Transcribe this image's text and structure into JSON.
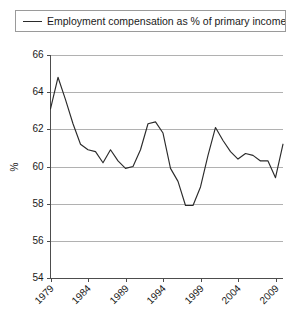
{
  "legend": {
    "position": "top",
    "boxed": true,
    "entries": [
      {
        "label": "Employment compensation as % of primary incomes",
        "marker": "line-marker",
        "color": "#2b2b2b"
      }
    ]
  },
  "axes": {
    "y_title": "%",
    "y_ticks": [
      "54",
      "56",
      "58",
      "60",
      "62",
      "64",
      "66"
    ],
    "x_ticks": [
      "1979",
      "1984",
      "1989",
      "1994",
      "1999",
      "2004",
      "2009"
    ]
  },
  "colors": {
    "line": "#2b2b2b",
    "grid": "#a8a8a8",
    "axis": "#4d4d4d",
    "background": "#ffffff",
    "legend_border": "#9a9a9a"
  },
  "chart_data": {
    "type": "line",
    "title": "",
    "xlabel": "",
    "ylabel": "%",
    "ylim": [
      54,
      66
    ],
    "xlim": [
      1979,
      2010
    ],
    "y_tick_step": 2,
    "grid": true,
    "legend_position": "top",
    "x": [
      1979,
      1980,
      1981,
      1982,
      1983,
      1984,
      1985,
      1986,
      1987,
      1988,
      1989,
      1990,
      1991,
      1992,
      1993,
      1994,
      1995,
      1996,
      1997,
      1998,
      1999,
      2000,
      2001,
      2002,
      2003,
      2004,
      2005,
      2006,
      2007,
      2008,
      2009,
      2010
    ],
    "series": [
      {
        "name": "Employment compensation as % of primary incomes",
        "color": "#2b2b2b",
        "values": [
          63.1,
          64.8,
          63.6,
          62.3,
          61.2,
          60.9,
          60.8,
          60.2,
          60.9,
          60.3,
          59.9,
          60.0,
          60.9,
          62.3,
          62.4,
          61.8,
          59.9,
          59.2,
          57.9,
          57.9,
          58.9,
          60.6,
          62.1,
          61.4,
          60.8,
          60.4,
          60.7,
          60.6,
          60.3,
          60.3,
          59.4,
          61.2
        ]
      }
    ]
  }
}
